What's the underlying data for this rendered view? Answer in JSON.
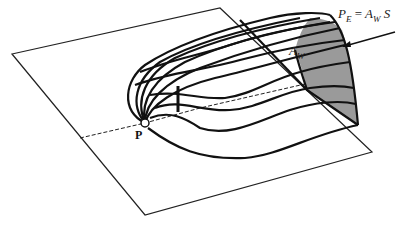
{
  "figure": {
    "top_caption_fragment": "",
    "point_label": "P",
    "area_label": {
      "base": "A",
      "sub": "W"
    },
    "formula": {
      "lhs": {
        "base": "P",
        "sub": "E"
      },
      "equals": "=",
      "rhs_a": {
        "base": "A",
        "sub": "W"
      },
      "rhs_b": "S"
    },
    "colors": {
      "line": "#111111",
      "shaded_region": "#999999",
      "background": "#ffffff"
    }
  }
}
